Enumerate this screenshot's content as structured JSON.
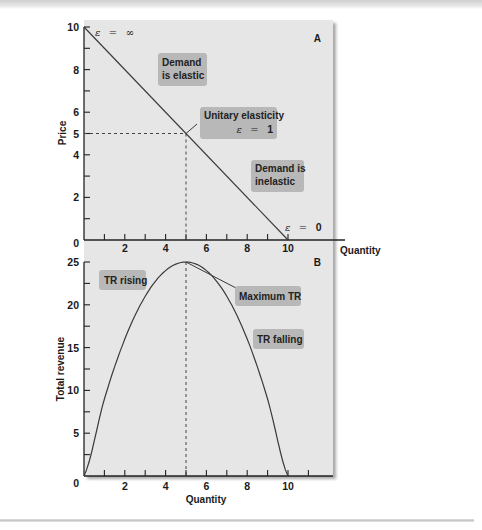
{
  "chart_data": [
    {
      "panel": "A",
      "type": "line",
      "title": "",
      "xlabel": "Quantity",
      "ylabel": "Price",
      "xlim": [
        0,
        12
      ],
      "ylim": [
        0,
        10
      ],
      "x_ticks": [
        1,
        2,
        3,
        4,
        5,
        6,
        7,
        8,
        9,
        10
      ],
      "x_tick_labels": [
        "2",
        "4",
        "6",
        "8",
        "10"
      ],
      "x_tick_label_values": [
        2,
        4,
        6,
        8,
        10
      ],
      "y_ticks": [
        1,
        2,
        3,
        4,
        5,
        6,
        7,
        8,
        9,
        10
      ],
      "y_tick_labels": [
        "0",
        "2",
        "4",
        "5",
        "6",
        "8",
        "10"
      ],
      "y_tick_label_values": [
        0,
        2,
        4,
        5,
        6,
        8,
        10
      ],
      "series": [
        {
          "name": "Demand",
          "x": [
            0,
            10
          ],
          "y": [
            10,
            0
          ]
        }
      ],
      "reference_lines": [
        {
          "type": "horizontal-dashed",
          "y": 5,
          "x_range": [
            0,
            5
          ]
        },
        {
          "type": "vertical-dashed",
          "x": 5,
          "y_range": [
            0,
            5
          ]
        }
      ],
      "annotations": [
        {
          "text": "ε = ∞",
          "eps_symbol": "ε",
          "eps_value": "∞",
          "x": 0,
          "y": 10
        },
        {
          "text": "Demand is elastic",
          "lines": [
            "Demand",
            "is elastic"
          ]
        },
        {
          "text": "Unitary elasticity ε = 1",
          "lines": [
            "Unitary elasticity"
          ],
          "eps_symbol": "ε",
          "eps_value": "1",
          "x": 5,
          "y": 5
        },
        {
          "text": "Demand is inelastic",
          "lines": [
            "Demand is",
            "inelastic"
          ]
        },
        {
          "text": "ε = 0",
          "eps_symbol": "ε",
          "eps_value": "0",
          "x": 10,
          "y": 0
        }
      ],
      "grid": false
    },
    {
      "panel": "B",
      "type": "line",
      "title": "",
      "xlabel": "Quantity",
      "ylabel": "Total revenue",
      "xlim": [
        0,
        12
      ],
      "ylim": [
        0,
        25
      ],
      "x_ticks": [
        1,
        2,
        3,
        4,
        5,
        6,
        7,
        8,
        9,
        10,
        11
      ],
      "x_tick_labels": [
        "0",
        "2",
        "4",
        "6",
        "8",
        "10"
      ],
      "x_tick_label_values": [
        0,
        2,
        4,
        6,
        8,
        10
      ],
      "y_ticks": [
        2.5,
        5,
        7.5,
        10,
        12.5,
        15,
        17.5,
        20,
        22.5,
        25
      ],
      "y_tick_labels": [
        "5",
        "10",
        "15",
        "20",
        "25"
      ],
      "y_tick_label_values": [
        5,
        10,
        15,
        20,
        25
      ],
      "series": [
        {
          "name": "Total revenue (TR = P × Q, P = 10 − Q)",
          "x": [
            0,
            1,
            2,
            3,
            4,
            5,
            6,
            7,
            8,
            9,
            10
          ],
          "y": [
            0,
            9,
            16,
            21,
            24,
            25,
            24,
            21,
            16,
            9,
            0
          ]
        }
      ],
      "reference_lines": [
        {
          "type": "vertical-dashed",
          "x": 5,
          "y_range": [
            0,
            25
          ]
        }
      ],
      "annotations": [
        {
          "text": "TR rising"
        },
        {
          "text": "Maximum TR",
          "x": 5,
          "y": 25
        },
        {
          "text": "TR falling"
        }
      ],
      "grid": false
    }
  ],
  "panelA": {
    "letter": "A",
    "ylabel": "Price",
    "xlabel": "Quantity",
    "y_labels": {
      "v0": "0",
      "v2": "2",
      "v4": "4",
      "v5": "5",
      "v6": "6",
      "v8": "8",
      "v10": "10"
    },
    "x_labels": {
      "v2": "2",
      "v4": "4",
      "v6": "6",
      "v8": "8",
      "v10": "10"
    },
    "eps_symbol": "ε",
    "eps_equals": "=",
    "eps_inf": "∞",
    "eps_one": "1",
    "eps_zero": "0",
    "elastic_line1": "Demand",
    "elastic_line2": "is elastic",
    "unitary_line1": "Unitary elasticity",
    "inelastic_line1": "Demand is",
    "inelastic_line2": "inelastic"
  },
  "panelB": {
    "letter": "B",
    "ylabel": "Total revenue",
    "xlabel": "Quantity",
    "y_labels": {
      "v5": "5",
      "v10": "10",
      "v15": "15",
      "v20": "20",
      "v25": "25"
    },
    "x_labels": {
      "v0": "0",
      "v2": "2",
      "v4": "4",
      "v6": "6",
      "v8": "8",
      "v10": "10"
    },
    "tr_rising": "TR rising",
    "max_tr": "Maximum TR",
    "tr_falling": "TR falling"
  },
  "colors": {
    "panel_bg": "#e6e6e6",
    "label_box": "#b8b8b8",
    "line": "#3a3a3a",
    "axis": "#222222",
    "shadow": "#9a9a9a"
  }
}
